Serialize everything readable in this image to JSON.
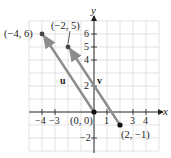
{
  "diagram": {
    "type": "coordinate-plane-vectors",
    "axes": {
      "x_label": "x",
      "y_label": "y",
      "x_ticks": [
        "-4",
        "-3",
        "1",
        "3",
        "4"
      ],
      "y_ticks": [
        "6",
        "5",
        "4",
        "2",
        "-2"
      ],
      "x_range": [
        -5,
        5
      ],
      "y_range": [
        -3,
        7
      ]
    },
    "points": [
      {
        "label": "(-4, 6)",
        "x": -4,
        "y": 6
      },
      {
        "label": "(-2, 5)",
        "x": -2,
        "y": 5
      },
      {
        "label": "(0, 0)",
        "x": 0,
        "y": 0
      },
      {
        "label": "(2, -1)",
        "x": 2,
        "y": -1
      }
    ],
    "vectors": [
      {
        "name": "u",
        "from": [
          0,
          0
        ],
        "to": [
          -4,
          6
        ]
      },
      {
        "name": "v",
        "from": [
          2,
          -1
        ],
        "to": [
          -2,
          5
        ]
      }
    ],
    "colors": {
      "vector": "#8c8c8c",
      "point": "#333333",
      "grid": "#d9d9d9",
      "axis": "#222222"
    }
  }
}
